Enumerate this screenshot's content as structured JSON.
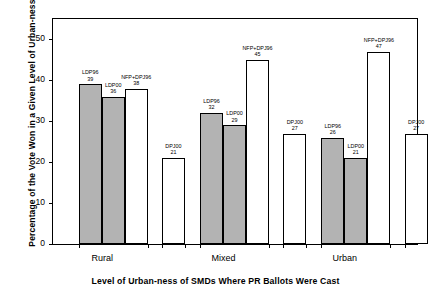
{
  "chart_data": {
    "type": "bar",
    "title": "",
    "xlabel": "Level of Urban-ness of SMDs Where PR Ballots Were Cast",
    "ylabel": "Percentage of the Vote Won in a Given Level of Urban-ness",
    "categories": [
      "Rural",
      "Mixed",
      "Urban"
    ],
    "ylim": [
      0,
      55
    ],
    "yticks": [
      0,
      10,
      20,
      30,
      40,
      50
    ],
    "grid": false,
    "legend": "none",
    "series": [
      {
        "name": "LDP96",
        "fill": "gray",
        "values": [
          39,
          32,
          26
        ]
      },
      {
        "name": "LDP00",
        "fill": "gray",
        "values": [
          36,
          29,
          21
        ]
      },
      {
        "name": "NFP+DPJ96",
        "fill": "white",
        "values": [
          38,
          45,
          47
        ]
      },
      {
        "name": "DPJ00",
        "fill": "white",
        "values": [
          21,
          27,
          27
        ]
      }
    ],
    "bar_annotations": [
      {
        "group": "Rural",
        "label": "LDP96",
        "value": 39
      },
      {
        "group": "Rural",
        "label": "LDP00",
        "value": 36
      },
      {
        "group": "Rural",
        "label": "NFP+DPJ96",
        "value": 38
      },
      {
        "group": "Rural",
        "label": "DPJ00",
        "value": 21
      },
      {
        "group": "Mixed",
        "label": "LDP96",
        "value": 32
      },
      {
        "group": "Mixed",
        "label": "LDP00",
        "value": 29
      },
      {
        "group": "Mixed",
        "label": "NFP+DPJ96",
        "value": 45
      },
      {
        "group": "Mixed",
        "label": "DPJ00",
        "value": 27
      },
      {
        "group": "Urban",
        "label": "LDP96",
        "value": 26
      },
      {
        "group": "Urban",
        "label": "LDP00",
        "value": 21
      },
      {
        "group": "Urban",
        "label": "NFP+DPJ96",
        "value": 47
      },
      {
        "group": "Urban",
        "label": "DPJ00",
        "value": 27
      }
    ],
    "colors": {
      "filled_bar": "#b3b3b3",
      "open_bar": "#ffffff",
      "outline": "#000000",
      "background": "#ffffff"
    }
  }
}
